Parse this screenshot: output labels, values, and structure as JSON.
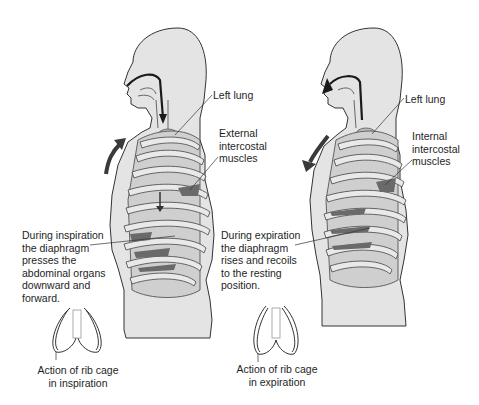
{
  "diagram": {
    "colors": {
      "skin": "#e4e4e4",
      "outline": "#333333",
      "rib": "#d0d0d0",
      "muscle": "#6a6a6a",
      "lung": "#bdbdbd",
      "arrow": "#3a3a3a"
    },
    "panels": [
      {
        "id": "inspiration",
        "labels": {
          "lung": "Left lung",
          "muscles": [
            "External",
            "intercostal",
            "muscles"
          ],
          "description": [
            "During inspiration",
            "the diaphragm",
            "presses the",
            "abdominal organs",
            "downward and",
            "forward."
          ]
        },
        "rib_cage_caption": [
          "Action of rib cage",
          "in inspiration"
        ],
        "air_flow": "in",
        "chest_motion": "up-forward"
      },
      {
        "id": "expiration",
        "labels": {
          "lung": "Left lung",
          "muscles": [
            "Internal",
            "intercostal",
            "muscles"
          ],
          "description": [
            "During expiration",
            "the diaphragm",
            "rises and recoils",
            "to the resting",
            "position."
          ]
        },
        "rib_cage_caption": [
          "Action of rib cage",
          "in expiration"
        ],
        "air_flow": "out",
        "chest_motion": "down-back"
      }
    ]
  }
}
